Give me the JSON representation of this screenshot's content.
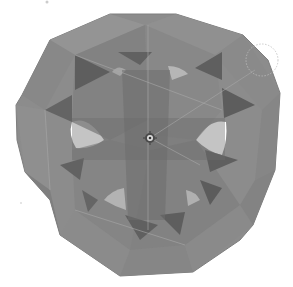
{
  "image": {
    "subject": "Translucent gray 3D polyhedron with star-shaped cutouts",
    "background": "#ffffff",
    "colors": {
      "outer_face": "#8e8e8e",
      "inner_face": "#7a7a7a",
      "dark_triangle": "#5f5f5f",
      "light_face": "#9c9c9c",
      "hole": "#ffffff",
      "edge": "#b0b0b0"
    },
    "center_marker": "origin-gizmo",
    "selection_circle": "dashed-circle"
  }
}
